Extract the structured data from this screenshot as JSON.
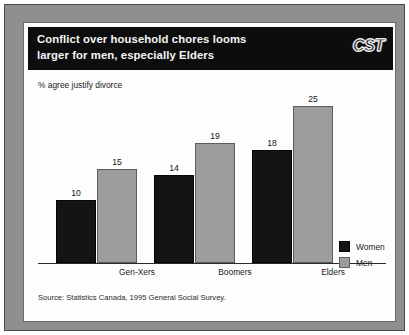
{
  "header": {
    "title": "Conflict over household chores looms\nlarger for men, especially Elders",
    "brand": "CST",
    "brand_icon": "cst-wordmark-logo"
  },
  "chart_data": {
    "type": "bar",
    "title": "Conflict over household chores looms larger for men, especially Elders",
    "subtitle": "",
    "ylabel": "% agree justify divorce",
    "xlabel": "",
    "categories": [
      "Gen-Xers",
      "Boomers",
      "Elders"
    ],
    "series": [
      {
        "name": "Women",
        "color": "#141414",
        "values": [
          10,
          14,
          18
        ]
      },
      {
        "name": "Men",
        "color": "#9c9c9c",
        "values": [
          15,
          19,
          25
        ]
      }
    ],
    "ylim": [
      0,
      27
    ],
    "grid": false,
    "legend_position": "right",
    "data_labels": true
  },
  "footer": {
    "source": "Source: Statistics Canada, 1995 General Social Survey."
  }
}
